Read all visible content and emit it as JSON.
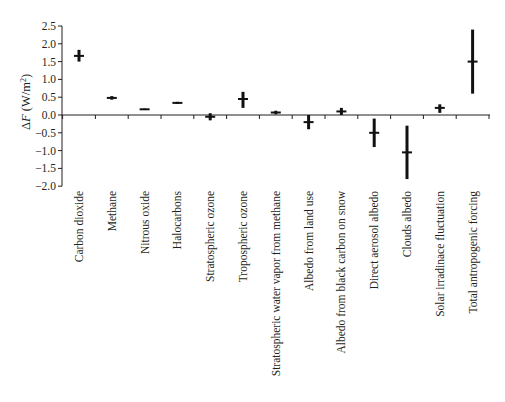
{
  "chart_data": {
    "type": "scatter",
    "subtype": "error-bar",
    "title": "",
    "xlabel": "",
    "ylabel": "ΔF (W/m²)",
    "ylabel_parts": {
      "italic": "F",
      "prefix": "Δ",
      "suffix": " (W/m",
      "sup": "2",
      "close": ")"
    },
    "ylim": [
      -2.0,
      2.5
    ],
    "yticks": [
      2.5,
      2.0,
      1.5,
      1.0,
      0.5,
      0.0,
      -0.5,
      -1.0,
      -1.5,
      -2.0
    ],
    "ytick_labels": [
      "2.5",
      "2.0",
      "1.5",
      "1.0",
      "0.5",
      "0.0",
      "−0.5",
      "−1.0",
      "−1.5",
      "−2.0"
    ],
    "grid": false,
    "legend": null,
    "categories": [
      "Carbon dioxide",
      "Methane",
      "Nitrous oxide",
      "Halocarbons",
      "Stratospheric ozone",
      "Tropospheric ozone",
      "Stratospheric water vapor from methane",
      "Albedo from land use",
      "Albedo from black carbon on snow",
      "Direct aerosol albedo",
      "Clouds albedo",
      "Solar irradinace fluctuation",
      "Total antropogenic forcing"
    ],
    "values": [
      1.66,
      0.48,
      0.16,
      0.34,
      -0.05,
      0.45,
      0.07,
      -0.2,
      0.1,
      -0.5,
      -1.05,
      0.2,
      1.5
    ],
    "low": [
      1.5,
      0.43,
      0.14,
      0.31,
      -0.15,
      0.2,
      0.02,
      -0.4,
      0.0,
      -0.9,
      -1.8,
      0.06,
      0.6
    ],
    "high": [
      1.83,
      0.53,
      0.18,
      0.37,
      0.05,
      0.65,
      0.12,
      0.0,
      0.2,
      -0.1,
      -0.3,
      0.3,
      2.4
    ]
  },
  "colors": {
    "marker": "#111111",
    "axis": "#231f20",
    "background": "#ffffff"
  }
}
